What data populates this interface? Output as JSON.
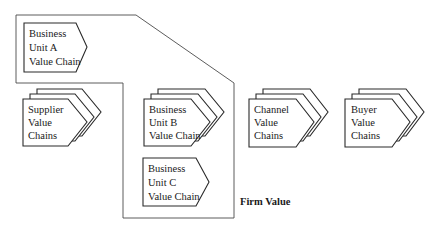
{
  "diagram": {
    "type": "value-system",
    "boundary_label": "Firm Value",
    "colors": {
      "stroke": "#2a2a2a",
      "boundary": "#4a4a4a",
      "text": "#1a1a1a",
      "background": "#ffffff"
    },
    "nodes": [
      {
        "id": "bu_a",
        "lines": [
          "Business",
          "Unit A",
          "Value Chain"
        ],
        "stacked": false,
        "inside_firm": true
      },
      {
        "id": "supplier",
        "lines": [
          "Supplier",
          "Value",
          "Chains"
        ],
        "stacked": true,
        "inside_firm": false
      },
      {
        "id": "bu_b",
        "lines": [
          "Business",
          "Unit B",
          "Value Chain"
        ],
        "stacked": true,
        "inside_firm": true
      },
      {
        "id": "bu_c",
        "lines": [
          "Business",
          "Unit C",
          "Value Chain"
        ],
        "stacked": false,
        "inside_firm": true
      },
      {
        "id": "channel",
        "lines": [
          "Channel",
          "Value",
          "Chains"
        ],
        "stacked": true,
        "inside_firm": false
      },
      {
        "id": "buyer",
        "lines": [
          "Buyer",
          "Value",
          "Chains"
        ],
        "stacked": true,
        "inside_firm": false
      }
    ]
  }
}
